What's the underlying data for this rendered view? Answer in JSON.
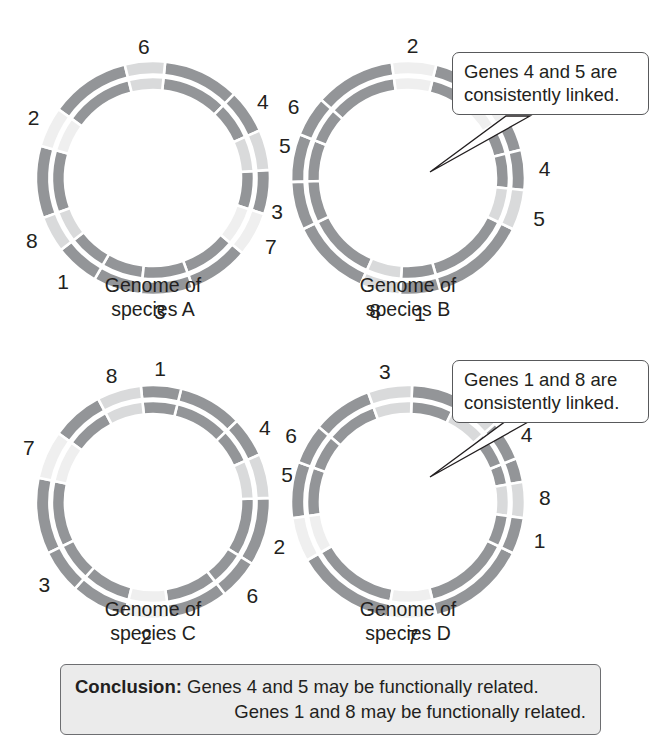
{
  "figure": {
    "type": "comparative-genomics-circular-maps",
    "gene_count": 8
  },
  "colors": {
    "gene_dark": "#939598",
    "gene_light": "#d9dadb",
    "gene_lighter": "#efefef",
    "separator": "#ffffff",
    "text": "#231f20",
    "callout_border": "#58595b",
    "conclusion_bg": "#ebebeb",
    "conclusion_border": "#6d6e71",
    "pointer": "#231f20"
  },
  "genomes": [
    {
      "id": "a",
      "caption": "Genome of\nspecies A",
      "genes": [
        {
          "label": "6",
          "start": -14,
          "end": 6,
          "shade": "light",
          "label_angle": -4,
          "label_r": 132
        },
        {
          "label": "4",
          "start": 44,
          "end": 66,
          "shade": "dark",
          "label_angle": 55,
          "label_r": 134
        },
        {
          "label": "5",
          "start": 66,
          "end": 86,
          "shade": "light",
          "label_angle": 76,
          "label_r": 136
        },
        {
          "label": "7",
          "start": 108,
          "end": 130,
          "shade": "lighter",
          "label_angle": 120,
          "label_r": 136
        },
        {
          "label": "3",
          "start": 160,
          "end": 186,
          "shade": "dark",
          "label_angle": 177,
          "label_r": 133
        },
        {
          "label": "1",
          "start": 210,
          "end": 232,
          "shade": "dark",
          "label_angle": 221,
          "label_r": 137
        },
        {
          "label": "8",
          "start": 232,
          "end": 250,
          "shade": "light",
          "label_angle": 243,
          "label_r": 136
        },
        {
          "label": "2",
          "start": 286,
          "end": 306,
          "shade": "lighter",
          "label_angle": 297,
          "label_r": 134
        }
      ],
      "filler": [
        [
          6,
          44
        ],
        [
          86,
          108
        ],
        [
          130,
          160
        ],
        [
          186,
          210
        ],
        [
          250,
          286
        ],
        [
          306,
          346
        ]
      ],
      "callout": null
    },
    {
      "id": "b",
      "caption": "Genome of\nspecies B",
      "genes": [
        {
          "label": "2",
          "start": -8,
          "end": 14,
          "shade": "lighter",
          "label_angle": 2,
          "label_r": 133
        },
        {
          "label": "7",
          "start": 36,
          "end": 58,
          "shade": "lighter",
          "label_angle": 47,
          "label_r": 136
        },
        {
          "label": "4",
          "start": 76,
          "end": 96,
          "shade": "dark",
          "label_angle": 86,
          "label_r": 137
        },
        {
          "label": "5",
          "start": 96,
          "end": 116,
          "shade": "light",
          "label_angle": 107,
          "label_r": 137
        },
        {
          "label": "1",
          "start": 164,
          "end": 184,
          "shade": "dark",
          "label_angle": 175,
          "label_r": 136
        },
        {
          "label": "8",
          "start": 184,
          "end": 204,
          "shade": "light",
          "label_angle": 194,
          "label_r": 136
        },
        {
          "label": "3",
          "start": 244,
          "end": 268,
          "shade": "dark",
          "label_angle": 256,
          "label_r": 135
        },
        {
          "label": "6",
          "start": 292,
          "end": 312,
          "shade": "dark",
          "label_angle": 302,
          "label_r": 135
        }
      ],
      "filler": [
        [
          14,
          36
        ],
        [
          58,
          76
        ],
        [
          116,
          164
        ],
        [
          204,
          244
        ],
        [
          268,
          292
        ],
        [
          312,
          352
        ]
      ],
      "callout": {
        "text": "Genes 4 and 5 are\nconsistently linked.",
        "points_to": [
          "4",
          "5"
        ]
      }
    },
    {
      "id": "c",
      "caption": "Genome of\nspecies C",
      "genes": [
        {
          "label": "1",
          "start": -6,
          "end": 14,
          "shade": "dark",
          "label_angle": 3,
          "label_r": 134
        },
        {
          "label": "8",
          "start": -28,
          "end": -6,
          "shade": "light",
          "label_angle": -18,
          "label_r": 134
        },
        {
          "label": "4",
          "start": 46,
          "end": 66,
          "shade": "dark",
          "label_angle": 56,
          "label_r": 135
        },
        {
          "label": "5",
          "start": 66,
          "end": 88,
          "shade": "light",
          "label_angle": 78,
          "label_r": 137
        },
        {
          "label": "6",
          "start": 122,
          "end": 142,
          "shade": "dark",
          "label_angle": 133,
          "label_r": 136
        },
        {
          "label": "2",
          "start": 172,
          "end": 194,
          "shade": "lighter",
          "label_angle": 183,
          "label_r": 134
        },
        {
          "label": "3",
          "start": 222,
          "end": 244,
          "shade": "dark",
          "label_angle": 233,
          "label_r": 136
        },
        {
          "label": "7",
          "start": 282,
          "end": 306,
          "shade": "lighter",
          "label_angle": 294,
          "label_r": 136
        }
      ],
      "filler": [
        [
          14,
          46
        ],
        [
          88,
          122
        ],
        [
          142,
          172
        ],
        [
          194,
          222
        ],
        [
          244,
          282
        ],
        [
          306,
          332
        ]
      ],
      "callout": null
    },
    {
      "id": "d",
      "caption": "Genome of\nspecies D",
      "genes": [
        {
          "label": "3",
          "start": -20,
          "end": 2,
          "shade": "light",
          "label_angle": -10,
          "label_r": 133
        },
        {
          "label": "5",
          "start": 26,
          "end": 48,
          "shade": "light",
          "label_angle": 36,
          "label_r": 136
        },
        {
          "label": "4",
          "start": 48,
          "end": 68,
          "shade": "dark",
          "label_angle": 60,
          "label_r": 137
        },
        {
          "label": "8",
          "start": 80,
          "end": 98,
          "shade": "light",
          "label_angle": 88,
          "label_r": 137
        },
        {
          "label": "1",
          "start": 98,
          "end": 116,
          "shade": "dark",
          "label_angle": 106,
          "label_r": 137
        },
        {
          "label": "7",
          "start": 166,
          "end": 190,
          "shade": "lighter",
          "label_angle": 178,
          "label_r": 134
        },
        {
          "label": "2",
          "start": 240,
          "end": 262,
          "shade": "lighter",
          "label_angle": 251,
          "label_r": 136
        },
        {
          "label": "6",
          "start": 290,
          "end": 310,
          "shade": "dark",
          "label_angle": 300,
          "label_r": 135
        }
      ],
      "filler": [
        [
          2,
          26
        ],
        [
          68,
          80
        ],
        [
          116,
          166
        ],
        [
          190,
          240
        ],
        [
          262,
          290
        ],
        [
          310,
          340
        ]
      ],
      "callout": {
        "text": "Genes 1 and 8 are\nconsistently linked.",
        "points_to": [
          "1",
          "8"
        ]
      }
    }
  ],
  "conclusion": {
    "label": "Conclusion:",
    "line1": " Genes 4 and 5 may be functionally related.",
    "line2": "Genes 1 and 8 may be functionally related."
  }
}
